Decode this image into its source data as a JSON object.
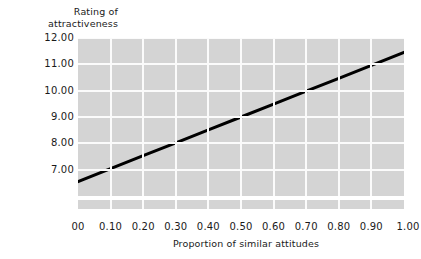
{
  "chart_data": {
    "type": "line",
    "title": "",
    "ylabel": "Rating of\nattractiveness",
    "xlabel": "Proportion of similar attitudes",
    "ylim": [
      6.0,
      12.0
    ],
    "xlim": [
      0.0,
      1.0
    ],
    "grid": true,
    "legend": null,
    "y_ticks": [
      {
        "value": 12.0,
        "label": "12.00"
      },
      {
        "value": 11.0,
        "label": "11.00"
      },
      {
        "value": 10.0,
        "label": "10.00"
      },
      {
        "value": 9.0,
        "label": "9.00"
      },
      {
        "value": 8.0,
        "label": "8.00"
      },
      {
        "value": 7.0,
        "label": "7.00"
      }
    ],
    "x_ticks": [
      {
        "value": 0.0,
        "label": "00"
      },
      {
        "value": 0.1,
        "label": "0.10"
      },
      {
        "value": 0.2,
        "label": "0.20"
      },
      {
        "value": 0.3,
        "label": "0.30"
      },
      {
        "value": 0.4,
        "label": "0.40"
      },
      {
        "value": 0.5,
        "label": "0.50"
      },
      {
        "value": 0.6,
        "label": "0.60"
      },
      {
        "value": 0.7,
        "label": "0.70"
      },
      {
        "value": 0.8,
        "label": "0.80"
      },
      {
        "value": 0.9,
        "label": "0.90"
      },
      {
        "value": 1.0,
        "label": "1.00"
      }
    ],
    "series": [
      {
        "name": "attractiveness rating",
        "color": "#000000",
        "line_width": 3,
        "x": [
          0.0,
          0.1,
          0.2,
          0.3,
          0.4,
          0.5,
          0.6,
          0.7,
          0.8,
          0.9,
          1.0
        ],
        "values": [
          6.55,
          7.04,
          7.53,
          8.02,
          8.51,
          9.0,
          9.49,
          9.98,
          10.47,
          10.96,
          11.45
        ]
      }
    ],
    "colors": {
      "panel_background": "#d4d4d4",
      "gridline": "#fbfbfb",
      "line": "#000000",
      "text": "#1a1a1a",
      "page_background": "#ffffff"
    }
  }
}
